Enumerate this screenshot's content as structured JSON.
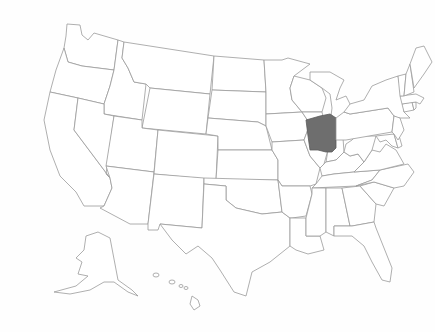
{
  "map": {
    "type": "choropleth",
    "region": "United States",
    "highlighted_states": [
      "Ohio"
    ],
    "colors": {
      "highlight_fill": "#6e6e6e",
      "default_fill": "#ffffff",
      "border": "#9a9a9a",
      "background": "#fefefe"
    },
    "insets": [
      "Alaska",
      "Hawaii"
    ]
  }
}
